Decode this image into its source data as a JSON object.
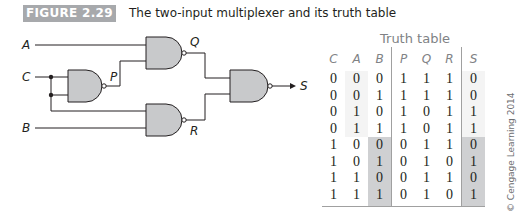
{
  "figure": {
    "label": "FIGURE 2.29",
    "title": "The two-input multiplexer and its truth table",
    "label_bg_color": "#a7a9ac"
  },
  "circuit": {
    "inputs": [
      "A",
      "C",
      "B"
    ],
    "internal_signals": [
      "P",
      "Q",
      "R"
    ],
    "output": "S",
    "gates": [
      {
        "id": "gate-p",
        "type": "NAND",
        "inputs": [
          "C",
          "C"
        ],
        "output": "P"
      },
      {
        "id": "gate-q",
        "type": "NAND",
        "inputs": [
          "A",
          "P"
        ],
        "output": "Q"
      },
      {
        "id": "gate-r",
        "type": "NAND",
        "inputs": [
          "C",
          "B"
        ],
        "output": "R"
      },
      {
        "id": "gate-s",
        "type": "NAND",
        "inputs": [
          "Q",
          "R"
        ],
        "output": "S"
      }
    ],
    "gate_fill": "#c8c9cb"
  },
  "truth_table": {
    "title": "Truth table",
    "headers": [
      "C",
      "A",
      "B",
      "P",
      "Q",
      "R",
      "S"
    ],
    "rows": [
      [
        "0",
        "0",
        "0",
        "1",
        "1",
        "1",
        "0"
      ],
      [
        "0",
        "0",
        "1",
        "1",
        "1",
        "1",
        "0"
      ],
      [
        "0",
        "1",
        "0",
        "1",
        "0",
        "1",
        "1"
      ],
      [
        "0",
        "1",
        "1",
        "1",
        "0",
        "1",
        "1"
      ],
      [
        "1",
        "0",
        "0",
        "0",
        "1",
        "1",
        "0"
      ],
      [
        "1",
        "0",
        "1",
        "0",
        "1",
        "0",
        "1"
      ],
      [
        "1",
        "1",
        "0",
        "0",
        "1",
        "1",
        "0"
      ],
      [
        "1",
        "1",
        "1",
        "0",
        "1",
        "0",
        "1"
      ]
    ],
    "highlight_color": "#cfd0d2"
  },
  "copyright": "© Cengage Learning 2014"
}
